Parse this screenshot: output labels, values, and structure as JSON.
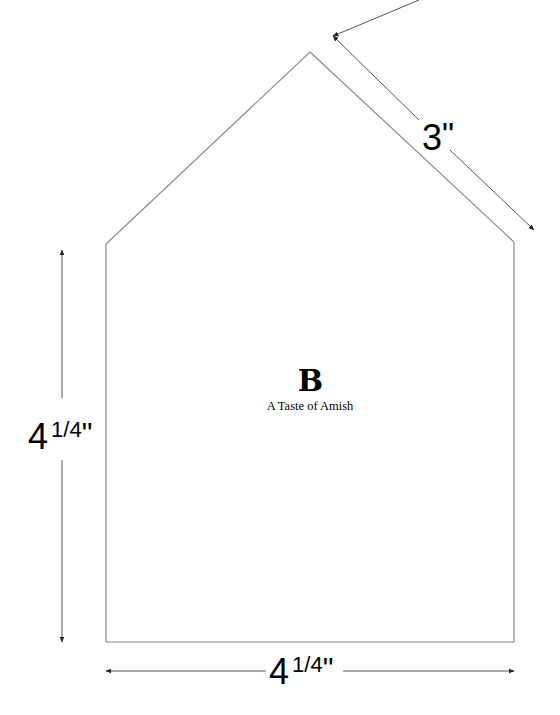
{
  "template": {
    "shape": "house",
    "stroke_color": "#8a8a8a",
    "arrow_color": "#333333",
    "logo_letter": "B",
    "brand_name": "A Taste of Amish"
  },
  "dimensions": {
    "roof_edge": {
      "value": "3",
      "unit": "\""
    },
    "height": {
      "whole": "4",
      "fraction": "1/4",
      "unit": "\""
    },
    "width": {
      "whole": "4",
      "fraction": "1/4",
      "unit": "\""
    }
  }
}
